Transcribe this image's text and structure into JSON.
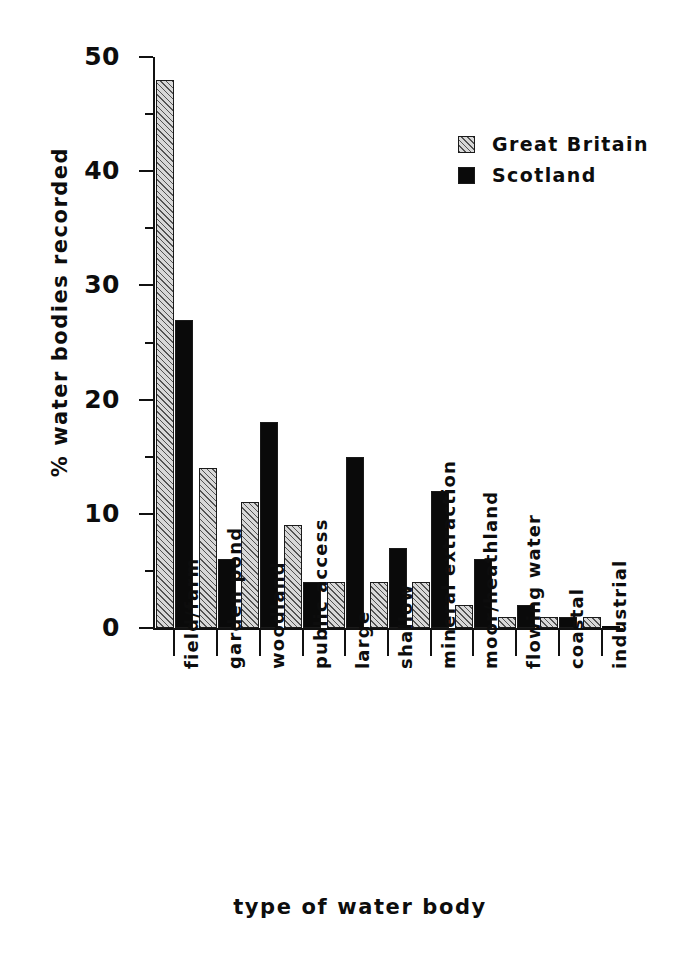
{
  "chart_data": {
    "type": "bar",
    "title": "",
    "xlabel": "type of water body",
    "ylabel": "% water bodies recorded",
    "ylim": [
      0,
      50
    ],
    "ytick_labels": [
      "0",
      "10",
      "20",
      "30",
      "40",
      "50"
    ],
    "ytick_values": [
      0,
      10,
      20,
      30,
      40,
      50
    ],
    "yminor_values": [
      5,
      15,
      25,
      35,
      45
    ],
    "grid": false,
    "legend_position": "upper-right",
    "categories": [
      "field/farm",
      "garden pond",
      "woodland",
      "public access",
      "large",
      "shallow",
      "mineral extraction",
      "moor/heathland",
      "flowing water",
      "coastal",
      "industrial"
    ],
    "series": [
      {
        "name": "Great Britain",
        "color": "#d8d8d8",
        "pattern": "hatched",
        "values": [
          48,
          14,
          11,
          9,
          4,
          4,
          4,
          2,
          1,
          1,
          1
        ]
      },
      {
        "name": "Scotland",
        "color": "#0a0a0a",
        "pattern": "solid",
        "values": [
          27,
          6,
          18,
          4,
          15,
          7,
          12,
          6,
          2,
          1,
          0
        ]
      }
    ]
  },
  "legend": {
    "items": [
      {
        "label": "Great Britain"
      },
      {
        "label": "Scotland"
      }
    ]
  }
}
